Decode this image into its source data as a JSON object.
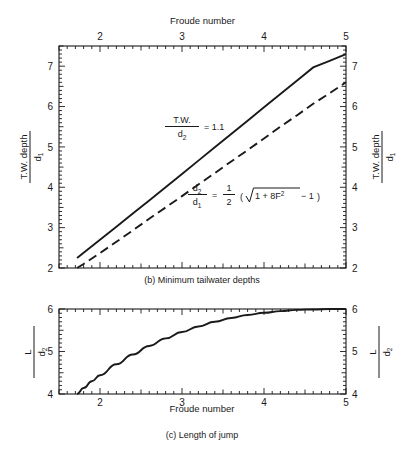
{
  "figure": {
    "panels": [
      {
        "id": "b",
        "caption": "(b)  Minimum tailwater depths",
        "top_axis_title": "Froude number",
        "left_axis_title_num": "T.W. depth",
        "left_axis_title_den": "d",
        "left_axis_title_den_sub": "1",
        "right_axis_title_num": "T.W. depth",
        "right_axis_title_den": "d",
        "right_axis_title_den_sub": "1",
        "x_ticks": [
          "2",
          "3",
          "4",
          "5"
        ],
        "y_ticks": [
          "2",
          "3",
          "4",
          "5",
          "6",
          "7"
        ],
        "annotation_1": {
          "num": "T.W.",
          "den": "d",
          "den_sub": "2",
          "rhs": "= 1.1"
        },
        "annotation_2": {
          "num": "d",
          "num_sub": "2",
          "den": "d",
          "den_sub": "1",
          "eq": "=",
          "frac_num": "1",
          "frac_den": "2",
          "paren_open": "(",
          "radicand": "1 + 8F",
          "radicand_sup": "2",
          "tail": "− 1",
          "paren_close": ")"
        }
      },
      {
        "id": "c",
        "caption": "(c)  Length of jump",
        "bottom_axis_title": "Froude number",
        "left_axis_title_num": "L",
        "left_axis_title_den": "d",
        "left_axis_title_den_sub": "2",
        "right_axis_title_num": "L",
        "right_axis_title_den": "d",
        "right_axis_title_den_sub": "2",
        "x_ticks": [
          "2",
          "3",
          "4",
          "5"
        ],
        "y_ticks": [
          "4",
          "5",
          "6"
        ]
      }
    ]
  },
  "colors": {
    "ink": "#1a1a1a",
    "curve": "#000000",
    "background": "#ffffff"
  },
  "chart_data": [
    {
      "type": "line",
      "panel": "b",
      "title": "(b)  Minimum tailwater depths",
      "xlabel": "Froude number",
      "ylabel": "T.W. depth / d1",
      "xlim": [
        1.5,
        5.0
      ],
      "ylim": [
        2.0,
        7.5
      ],
      "grid": false,
      "legend": "none",
      "x_major_ticks": [
        2,
        3,
        4,
        5
      ],
      "y_major_ticks": [
        2,
        3,
        4,
        5,
        6,
        7
      ],
      "minor_tick_step": 0.1,
      "series": [
        {
          "name": "T.W./d2 = 1.1",
          "style": "solid",
          "x": [
            1.72,
            1.8,
            2.0,
            2.2,
            2.4,
            2.6,
            2.8,
            3.0,
            3.2,
            3.4,
            3.6,
            3.8,
            4.0,
            4.2,
            4.4,
            4.6,
            4.8,
            5.0
          ],
          "y": [
            2.25,
            2.38,
            2.7,
            3.02,
            3.35,
            3.67,
            4.0,
            4.33,
            4.66,
            4.99,
            5.32,
            5.65,
            5.98,
            6.31,
            6.64,
            6.97,
            7.13,
            7.3
          ]
        },
        {
          "name": "d2/d1 = 1/2 (sqrt(1+8F^2) - 1)",
          "style": "dashed",
          "x": [
            1.72,
            1.8,
            2.0,
            2.2,
            2.4,
            2.6,
            2.8,
            3.0,
            3.2,
            3.4,
            3.6,
            3.8,
            4.0,
            4.2,
            4.4,
            4.6,
            4.8,
            5.0
          ],
          "y": [
            2.0,
            2.1,
            2.37,
            2.65,
            2.93,
            3.22,
            3.5,
            3.78,
            4.07,
            4.35,
            4.64,
            4.92,
            5.21,
            5.5,
            5.78,
            6.07,
            6.33,
            6.6
          ]
        }
      ],
      "annotations": [
        {
          "text": "T.W./d2 = 1.1",
          "x": 2.65,
          "y": 5.35
        },
        {
          "text": "d2/d1 = 1/2 (sqrt(1 + 8F^2) - 1)",
          "x": 3.35,
          "y": 3.65
        }
      ]
    },
    {
      "type": "line",
      "panel": "c",
      "title": "(c)  Length of jump",
      "xlabel": "Froude number",
      "ylabel": "L / d2",
      "xlim": [
        1.5,
        5.0
      ],
      "ylim": [
        4.0,
        6.0
      ],
      "grid": false,
      "legend": "none",
      "x_major_ticks": [
        2,
        3,
        4,
        5
      ],
      "y_major_ticks": [
        4,
        5,
        6
      ],
      "minor_tick_step": 0.1,
      "series": [
        {
          "name": "L/d2",
          "style": "solid",
          "x": [
            1.72,
            1.8,
            1.9,
            2.0,
            2.2,
            2.4,
            2.6,
            2.8,
            3.0,
            3.2,
            3.4,
            3.6,
            3.8,
            4.0,
            4.2,
            4.4,
            4.6,
            4.8,
            5.0
          ],
          "y": [
            4.0,
            4.14,
            4.3,
            4.44,
            4.7,
            4.93,
            5.13,
            5.31,
            5.46,
            5.59,
            5.7,
            5.79,
            5.86,
            5.91,
            5.95,
            5.98,
            5.99,
            6.0,
            6.0
          ]
        }
      ]
    }
  ]
}
